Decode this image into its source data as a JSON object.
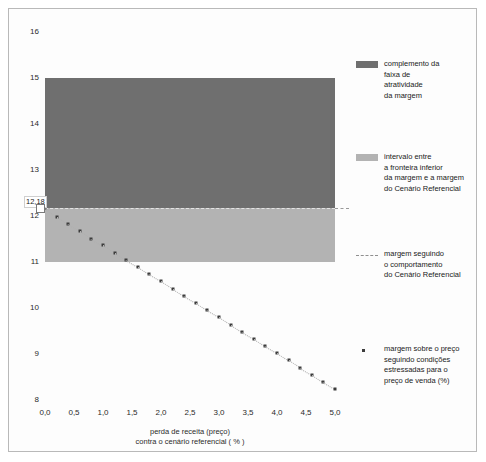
{
  "chart_data": {
    "type": "scatter",
    "title": "",
    "subtitle": "",
    "xlabel_line1": "perda de receita (preço)",
    "xlabel_line2": "contra o cenário referencial ( % )",
    "ylabel": "",
    "xlim": [
      0.0,
      5.0
    ],
    "ylim": [
      8,
      16
    ],
    "grid": false,
    "legend_position": "right",
    "x_ticks": [
      "0,0",
      "0,5",
      "1,0",
      "1,5",
      "2,0",
      "2,5",
      "3,0",
      "3,5",
      "4,0",
      "4,5",
      "5,0"
    ],
    "x_tick_values": [
      0.0,
      0.5,
      1.0,
      1.5,
      2.0,
      2.5,
      3.0,
      3.5,
      4.0,
      4.5,
      5.0
    ],
    "y_ticks": [
      "16",
      "15",
      "14",
      "13",
      "12",
      "11",
      "10",
      "9",
      "8"
    ],
    "y_tick_values": [
      16,
      15,
      14,
      13,
      12,
      11,
      10,
      9,
      8
    ],
    "annotation_value": "12,18",
    "annotation_y": 12.18,
    "annotation_x": 0.0,
    "bands": [
      {
        "name": "complemento da faixa de atratividade da margem",
        "color": "#6f6f6f",
        "y_top": 15.0,
        "y_bottom": 12.18,
        "x_start": 0.0,
        "x_end": 5.0
      },
      {
        "name": "intervalo entre a fronteira inferior da margem e a margem do Cenário Referencial",
        "color": "#b3b3b3",
        "y_top": 12.18,
        "y_bottom": 11.0,
        "x_start": 0.0,
        "x_end": 5.0
      }
    ],
    "reference_line": {
      "name": "margem seguindo o comportamento do Cenário Referencial",
      "style": "dashed",
      "color": "#9a9a9a",
      "y": 12.18,
      "x_start": 0.0,
      "x_end": 5.0
    },
    "series": [
      {
        "name": "margem sobre o preço seguindo condições estressadas para o preço de venda (%)",
        "marker": "square",
        "color": "#3c3c3c",
        "x": [
          0.0,
          0.2,
          0.4,
          0.6,
          0.8,
          1.0,
          1.2,
          1.4,
          1.6,
          1.8,
          2.0,
          2.2,
          2.4,
          2.6,
          2.8,
          3.0,
          3.2,
          3.4,
          3.6,
          3.8,
          4.0,
          4.2,
          4.4,
          4.6,
          4.8,
          5.0
        ],
        "y": [
          12.18,
          11.98,
          11.82,
          11.67,
          11.51,
          11.36,
          11.2,
          11.04,
          10.89,
          10.73,
          10.58,
          10.42,
          10.26,
          10.11,
          9.95,
          9.8,
          9.64,
          9.48,
          9.33,
          9.17,
          9.02,
          8.86,
          8.7,
          8.55,
          8.39,
          8.24
        ]
      }
    ],
    "legend": [
      {
        "swatch": "block-dark",
        "color": "#6f6f6f",
        "lines": [
          "complemento da",
          "faixa de",
          "atratividade",
          "da margem"
        ]
      },
      {
        "swatch": "block-light",
        "color": "#b3b3b3",
        "lines": [
          "intervalo entre",
          "a fronteira inferior",
          "da margem e a margem",
          "do Cenário Referencial"
        ]
      },
      {
        "swatch": "dashed-line",
        "color": "#8f8f8f",
        "lines": [
          "margem seguindo",
          "o comportamento",
          "do Cenário Referencial"
        ]
      },
      {
        "swatch": "dot-marker",
        "color": "#3c3c3c",
        "lines": [
          "margem sobre o preço",
          "seguindo condições",
          "estressadas para o",
          "preço de venda (%)"
        ]
      }
    ]
  }
}
